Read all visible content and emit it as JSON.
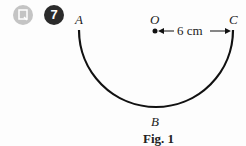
{
  "question": {
    "icon": "document-icon",
    "number": "7"
  },
  "figure": {
    "point_labels": {
      "A": "A",
      "O": "O",
      "C": "C",
      "B": "B"
    },
    "measurement": "6 cm",
    "caption": "Fig. 1",
    "colors": {
      "stroke": "#111111",
      "icon_gray": "#c4c4c4",
      "badge": "#2b2b2b"
    }
  }
}
